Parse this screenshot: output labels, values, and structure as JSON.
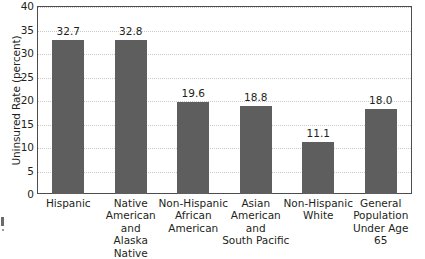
{
  "chart_data": {
    "type": "bar",
    "title": "",
    "xlabel": "",
    "ylabel": "Uninsured Rate (percent)",
    "ylim": [
      0,
      40
    ],
    "ytick_step": 5,
    "yticks": [
      "0",
      "5",
      "10",
      "15",
      "20",
      "25",
      "30",
      "35",
      "40"
    ],
    "grid": true,
    "legend": false,
    "bar_color": "#5e5e5e",
    "categories": [
      "Hispanic",
      "Native American and Alaska Native",
      "Non-Hispanic African American",
      "Asian American and South Pacific",
      "Non-Hispanic White",
      "General Population Under Age 65"
    ],
    "category_lines": [
      [
        "Hispanic"
      ],
      [
        "Native",
        "American",
        "and",
        "Alaska Native"
      ],
      [
        "Non-Hispanic",
        "African",
        "American"
      ],
      [
        "Asian",
        "American",
        "and",
        "South Pacific"
      ],
      [
        "Non-Hispanic",
        "White"
      ],
      [
        "General",
        "Population",
        "Under Age 65"
      ]
    ],
    "values": [
      32.7,
      32.8,
      19.6,
      18.8,
      11.1,
      18.0
    ],
    "value_labels": [
      "32.7",
      "32.8",
      "19.6",
      "18.8",
      "11.1",
      "18.0"
    ]
  }
}
